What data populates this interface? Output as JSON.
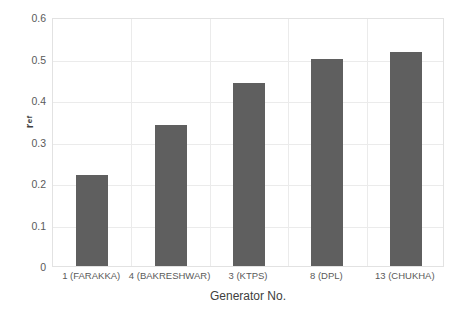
{
  "chart_data": {
    "type": "bar",
    "title": "",
    "subtitle": "",
    "categories": [
      "1 (FARAKKA)",
      "4 (BAKRESHWAR)",
      "3 (KTPS)",
      "8 (DPL)",
      "13 (CHUKHA)"
    ],
    "values": [
      0.22,
      0.34,
      0.44,
      0.498,
      0.515
    ],
    "series": [
      {
        "name": "r_ef",
        "values": [
          0.22,
          0.34,
          0.44,
          0.498,
          0.515
        ]
      }
    ],
    "xlabel": "Generator No.",
    "ylabel": "r_ef",
    "ylabel_base": "r",
    "ylabel_subscript": "ef",
    "ylim": [
      0,
      0.6
    ],
    "ytick_labels": [
      "0",
      "0.1",
      "0.2",
      "0.3",
      "0.4",
      "0.5",
      "0.6"
    ],
    "ytick_values": [
      0,
      0.1,
      0.2,
      0.3,
      0.4,
      0.5,
      0.6
    ],
    "grid": "horizontal-and-vertical",
    "legend": "none",
    "bar_color": "#5f5f5f",
    "gridline_color": "#ebebeb",
    "plot_border_color": "#e2e2e2",
    "text_color": "#5a5a5a",
    "background_color": "#ffffff"
  }
}
